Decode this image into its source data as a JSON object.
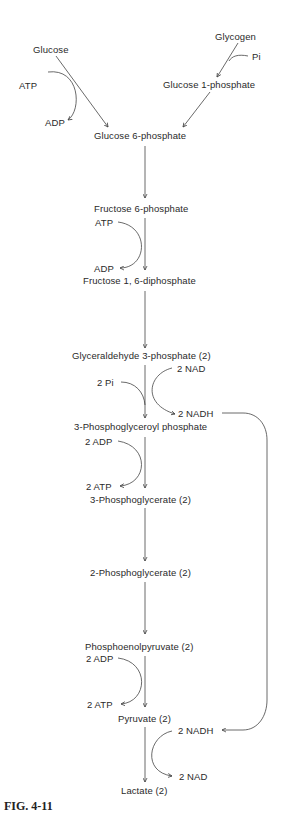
{
  "figure": {
    "caption": "FIG. 4-11"
  },
  "metabolites": {
    "glycogen": "Glycogen",
    "glucose": "Glucose",
    "glucose_1_phosphate": "Glucose 1-phosphate",
    "glucose_6_phosphate": "Glucose 6-phosphate",
    "fructose_6_phosphate": "Fructose 6-phosphate",
    "fructose_1_6_diphosphate": "Fructose 1, 6-diphosphate",
    "glyceraldehyde_3_phosphate": "Glyceraldehyde 3-phosphate (2)",
    "phosphoglyceroyl_phosphate": "3-Phosphoglyceroyl phosphate",
    "phosphoglycerate_3": "3-Phosphoglycerate (2)",
    "phosphoglycerate_2": "2-Phosphoglycerate (2)",
    "phosphoenolpyruvate": "Phosphoenolpyruvate (2)",
    "pyruvate": "Pyruvate (2)",
    "lactate": "Lactate (2)"
  },
  "cofactors": {
    "pi": "Pi",
    "atp_1": "ATP",
    "adp_1": "ADP",
    "atp_2": "ATP",
    "adp_2": "ADP",
    "two_pi": "2 Pi",
    "two_nad_in": "2 NAD",
    "two_nadh_out": "2 NADH",
    "two_adp_1": "2 ADP",
    "two_atp_1": "2 ATP",
    "two_adp_2": "2 ADP",
    "two_atp_2": "2 ATP",
    "two_nadh_in": "2 NADH",
    "two_nad_out": "2 NAD"
  },
  "colors": {
    "text": "#2a2a2a",
    "lines": "#444444",
    "background": "#ffffff"
  }
}
